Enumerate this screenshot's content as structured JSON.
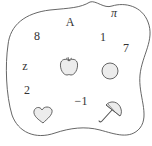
{
  "diagram": {
    "type": "set-blob",
    "colors": {
      "outline": "#555555",
      "fill": "#ececec",
      "text": "#333333"
    },
    "elements": [
      {
        "label": "π",
        "x": 114,
        "y": 13
      },
      {
        "label": "A",
        "x": 70,
        "y": 22
      },
      {
        "label": "8",
        "x": 37,
        "y": 36
      },
      {
        "label": "1",
        "x": 103,
        "y": 37
      },
      {
        "label": "7",
        "x": 126,
        "y": 48
      },
      {
        "label": "z",
        "x": 25,
        "y": 66
      },
      {
        "label": "2",
        "x": 27,
        "y": 90
      },
      {
        "label": "−1",
        "x": 81,
        "y": 101
      }
    ],
    "icons": [
      {
        "name": "apple-icon",
        "x": 69,
        "y": 67
      },
      {
        "name": "circle-icon",
        "x": 110,
        "y": 71
      },
      {
        "name": "heart-icon",
        "x": 43,
        "y": 115
      },
      {
        "name": "umbrella-icon",
        "x": 110,
        "y": 112
      }
    ]
  }
}
